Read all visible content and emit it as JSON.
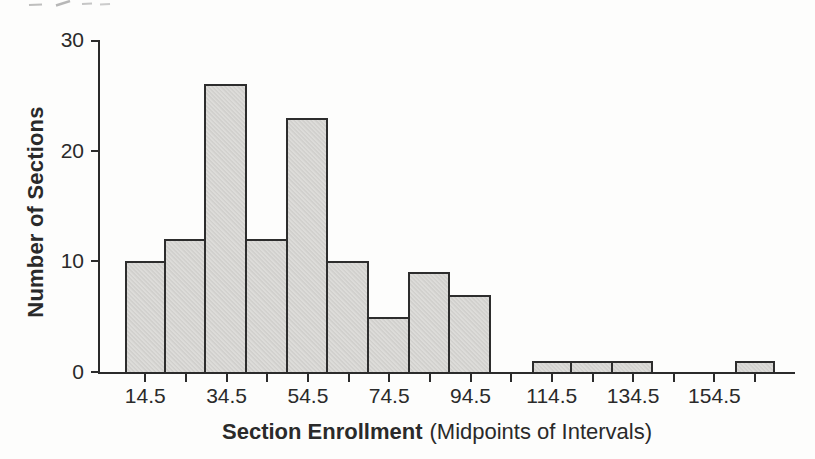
{
  "chart_data": {
    "type": "bar",
    "subtype": "histogram",
    "title": "",
    "xlabel": "Section Enrollment",
    "xlabel_note": "(Midpoints of Intervals)",
    "ylabel": "Number of Sections",
    "categories": [
      14.5,
      24.5,
      34.5,
      44.5,
      54.5,
      64.5,
      74.5,
      84.5,
      94.5,
      104.5,
      114.5,
      124.5,
      134.5,
      144.5,
      154.5,
      164.5
    ],
    "values": [
      10,
      12,
      26,
      12,
      23,
      10,
      5,
      9,
      7,
      0,
      1,
      1,
      1,
      0,
      0,
      1
    ],
    "bin_width": 10,
    "ylim": [
      0,
      30
    ],
    "yticks": [
      0,
      10,
      20,
      30
    ],
    "xtick_label_every": 2,
    "grid": false,
    "legend": false,
    "colors": {
      "bg": "#fdfdfc",
      "bar_fill": "#d8d7d4",
      "bar_border": "#2d2d2d",
      "axis": "#2b2b2b",
      "text": "#2a2a2a"
    }
  }
}
